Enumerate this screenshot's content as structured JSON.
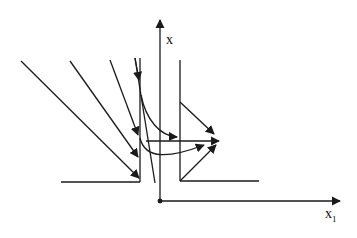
{
  "diagram": {
    "type": "phase-portrait",
    "axes": {
      "vertical_label": "x",
      "horizontal_label": "x",
      "horizontal_label_subscript": "1"
    },
    "colors": {
      "stroke": "#1a1a1a",
      "background": "#ffffff"
    }
  }
}
